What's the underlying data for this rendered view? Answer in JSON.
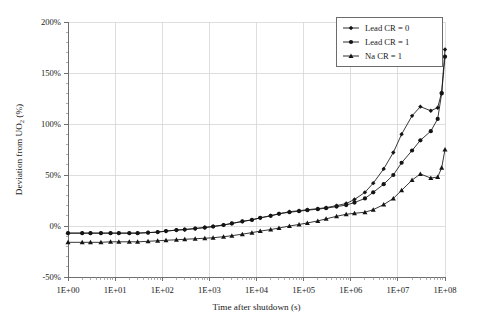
{
  "chart_data": {
    "type": "line",
    "title": "",
    "xlabel": "Time after shutdown (s)",
    "ylabel": "Deviation from UO2 (%)",
    "ylabel_parts": {
      "prefix": "Deviation from UO",
      "sub": "2",
      "suffix": " (%)"
    },
    "xscale": "log",
    "yscale": "linear",
    "xlim": [
      1,
      100000000
    ],
    "ylim": [
      -50,
      200
    ],
    "grid": true,
    "legend_position": "top-right",
    "xticklabels": [
      "1E+00",
      "1E+01",
      "1E+02",
      "1E+03",
      "1E+04",
      "1E+05",
      "1E+06",
      "1E+07",
      "1E+08"
    ],
    "yticklabels": [
      "-50%",
      "0%",
      "50%",
      "100%",
      "150%",
      "200%"
    ],
    "ytickvalues": [
      -50,
      0,
      50,
      100,
      150,
      200
    ],
    "series": [
      {
        "name": "Lead CR = 0",
        "marker": "diamond",
        "color": "#141414",
        "x": [
          1,
          2,
          3,
          5,
          8,
          12,
          20,
          30,
          50,
          80,
          120,
          200,
          300,
          500,
          800,
          1200,
          2000,
          3000,
          5000,
          8000,
          12000,
          20000,
          30000,
          50000,
          80000,
          120000,
          200000,
          300000,
          500000,
          800000,
          1200000,
          2000000,
          3000000,
          5000000,
          8000000,
          12000000,
          20000000,
          30000000,
          50000000,
          70000000,
          85000000,
          100000000
        ],
        "y": [
          -7,
          -7,
          -7,
          -7,
          -7,
          -7,
          -7,
          -7,
          -6.5,
          -6,
          -5,
          -4,
          -3.5,
          -2.5,
          -1.5,
          -0.5,
          1,
          2.5,
          4.5,
          6,
          8,
          10,
          12,
          14,
          15,
          16,
          17,
          18,
          20,
          22,
          26,
          33,
          42,
          56,
          72,
          90,
          108,
          117,
          113,
          116,
          131,
          173
        ]
      },
      {
        "name": "Lead CR = 1",
        "marker": "circle",
        "color": "#141414",
        "x": [
          1,
          2,
          3,
          5,
          8,
          12,
          20,
          30,
          50,
          80,
          120,
          200,
          300,
          500,
          800,
          1200,
          2000,
          3000,
          5000,
          8000,
          12000,
          20000,
          30000,
          50000,
          80000,
          120000,
          200000,
          300000,
          500000,
          800000,
          1200000,
          2000000,
          3000000,
          5000000,
          8000000,
          12000000,
          20000000,
          30000000,
          50000000,
          70000000,
          85000000,
          100000000
        ],
        "y": [
          -7,
          -7,
          -7,
          -7,
          -7,
          -7,
          -7,
          -7,
          -6.5,
          -6,
          -5,
          -4,
          -3.5,
          -2.5,
          -1.5,
          -0.5,
          1,
          2.5,
          4.5,
          6,
          8,
          10,
          12,
          13.5,
          14.5,
          15.5,
          16.5,
          17.5,
          19,
          20.5,
          23,
          27,
          33,
          41,
          50,
          62,
          74,
          84,
          93,
          105,
          130,
          166
        ]
      },
      {
        "name": "Na CR = 1",
        "marker": "triangle",
        "color": "#141414",
        "x": [
          1,
          2,
          3,
          5,
          8,
          12,
          20,
          30,
          50,
          80,
          120,
          200,
          300,
          500,
          800,
          1200,
          2000,
          3000,
          5000,
          8000,
          12000,
          20000,
          30000,
          50000,
          80000,
          120000,
          200000,
          300000,
          500000,
          800000,
          1200000,
          2000000,
          3000000,
          5000000,
          8000000,
          12000000,
          20000000,
          30000000,
          50000000,
          70000000,
          85000000,
          100000000
        ],
        "y": [
          -16,
          -16,
          -16,
          -16,
          -15.5,
          -15.5,
          -15.5,
          -15.5,
          -15,
          -14.5,
          -14,
          -13.5,
          -13,
          -12.5,
          -12,
          -11.5,
          -10.5,
          -9.5,
          -8,
          -6.5,
          -5,
          -3.5,
          -2,
          0,
          1.5,
          3,
          5,
          7,
          9.5,
          11.5,
          12.5,
          13.5,
          16,
          21,
          27,
          35,
          45,
          51,
          47,
          48,
          57,
          75
        ]
      }
    ]
  }
}
